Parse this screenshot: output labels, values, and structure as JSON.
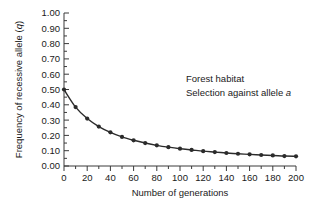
{
  "chart_data": {
    "type": "line",
    "title": "",
    "xlabel": "Number of generations",
    "ylabel": "Frequency of recessive allele (q)",
    "ylabel_plain": "Frequency of recessive allele (",
    "ylabel_italic": "q",
    "ylabel_tail": ")",
    "xlim": [
      0,
      200
    ],
    "ylim": [
      0.0,
      1.0
    ],
    "grid": false,
    "legend": null,
    "xticks": [
      0,
      20,
      40,
      60,
      80,
      100,
      120,
      140,
      160,
      180,
      200
    ],
    "xtick_labels": [
      "0",
      "20",
      "40",
      "60",
      "80",
      "100",
      "120",
      "140",
      "160",
      "180",
      "200"
    ],
    "xminor_step": 10,
    "yticks": [
      0.0,
      0.1,
      0.2,
      0.3,
      0.4,
      0.5,
      0.6,
      0.7,
      0.8,
      0.9,
      1.0
    ],
    "ytick_labels": [
      "0.00",
      "0.10",
      "0.20",
      "0.30",
      "0.40",
      "0.50",
      "0.60",
      "0.70",
      "0.80",
      "0.90",
      "1.00"
    ],
    "marker": "filled-circle",
    "line_color": "#2b2b2b",
    "marker_color": "#2b2b2b",
    "axis_color": "#3a3a3a",
    "background_color": "#ffffff",
    "series": [
      {
        "name": "Frequency of recessive allele a",
        "x": [
          0,
          10,
          20,
          30,
          40,
          50,
          60,
          70,
          80,
          90,
          100,
          110,
          120,
          130,
          140,
          150,
          160,
          170,
          180,
          190,
          200
        ],
        "values": [
          0.5,
          0.385,
          0.31,
          0.258,
          0.22,
          0.19,
          0.168,
          0.15,
          0.135,
          0.123,
          0.113,
          0.105,
          0.097,
          0.091,
          0.085,
          0.08,
          0.076,
          0.072,
          0.069,
          0.065,
          0.063
        ]
      }
    ],
    "annotations": [
      {
        "text": "Forest habitat",
        "x": 120,
        "y": 0.62
      },
      {
        "text": "Selection against allele ",
        "italic_suffix": "a",
        "x": 120,
        "y": 0.545
      }
    ]
  },
  "annotation_block": {
    "line1": "Forest habitat",
    "line2_plain": "Selection against allele ",
    "line2_italic": "a"
  },
  "axes": {
    "x_title": "Number of generations",
    "y_title_plain": "Frequency of recessive allele (",
    "y_title_italic": "q",
    "y_title_tail": ")"
  }
}
